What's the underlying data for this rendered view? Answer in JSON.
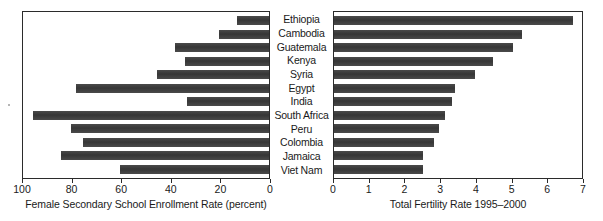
{
  "chart_data": {
    "type": "bar",
    "orientation": "horizontal",
    "layout": "back-to-back",
    "title": "",
    "categories": [
      "Ethiopia",
      "Cambodia",
      "Guatemala",
      "Kenya",
      "Syria",
      "Egypt",
      "India",
      "South Africa",
      "Peru",
      "Colombia",
      "Jamaica",
      "Viet Nam"
    ],
    "series": [
      {
        "name": "Female Secondary School Enrollment Rate (percent)",
        "panel": "left",
        "axis_direction": "reversed",
        "xlim": [
          100,
          0
        ],
        "ticks": [
          100,
          80,
          60,
          40,
          20,
          0
        ],
        "values": [
          13,
          20,
          38,
          34,
          45,
          78,
          33,
          95,
          80,
          75,
          84,
          60
        ]
      },
      {
        "name": "Total Fertility Rate 1995-2000",
        "panel": "right",
        "axis_direction": "normal",
        "xlim": [
          0,
          7
        ],
        "ticks": [
          0,
          1,
          2,
          3,
          4,
          5,
          6,
          7
        ],
        "values": [
          6.7,
          5.25,
          5.0,
          4.45,
          3.95,
          3.4,
          3.3,
          3.1,
          2.95,
          2.8,
          2.5,
          2.5
        ]
      }
    ],
    "grid": false,
    "legend": "none"
  },
  "left_panel": {
    "axis_title": "Female Secondary School Enrollment Rate (percent)",
    "tick_labels": [
      "100",
      "80",
      "60",
      "40",
      "20",
      "0"
    ]
  },
  "right_panel": {
    "axis_title": "Total Fertility Rate 1995–2000",
    "tick_labels": [
      "0",
      "1",
      "2",
      "3",
      "4",
      "5",
      "6",
      "7"
    ]
  },
  "style": {
    "bar_color": "#3b3b3b",
    "frame_color": "#2b2b2b",
    "background": "#ffffff"
  }
}
